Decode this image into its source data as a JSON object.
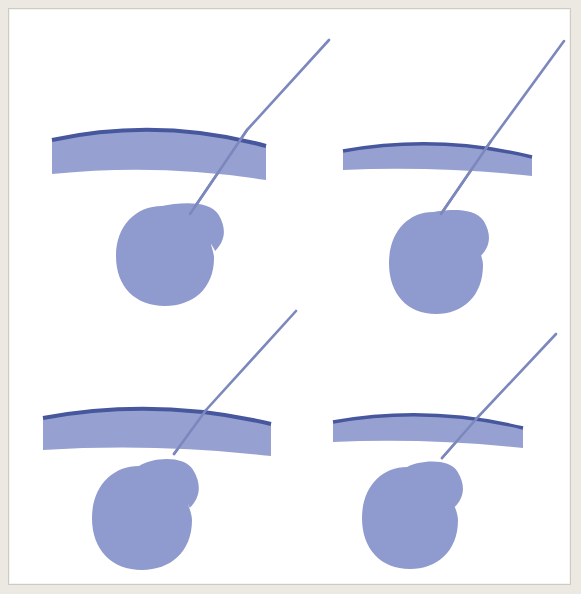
{
  "figure": {
    "background_color": "#ffffff",
    "paper_color": "#ece8e2",
    "frame_color": "#cfcac3",
    "width": 581,
    "height": 594
  },
  "palette": {
    "blob_fill": "#8f9ace",
    "blob_fill_alt": "#9aa3d2",
    "arc_fill": "#97a1d1",
    "arc_edge": "#47579e",
    "needle": "#7c88bd",
    "needle_dark": "#5a68a8",
    "white": "#ffffff"
  },
  "layout": {
    "rows": 2,
    "columns": 2,
    "cell_width": 280,
    "cell_height": 287
  },
  "chart_data": {
    "type": "scatter",
    "xlabel": "",
    "ylabel": "",
    "grid": false,
    "legend": null,
    "panels": [
      {
        "id": "panel-top-left",
        "label": "",
        "row": 0,
        "column": 0,
        "transducer_arc": {
          "start": [
            34,
            122
          ],
          "end": [
            248,
            128
          ],
          "outer_sag": 26,
          "inner_sag": 46,
          "band_thickness": 34
        },
        "needle": {
          "entry": [
            311,
            22
          ],
          "crossing": [
            229,
            112
          ],
          "tip": [
            172,
            196
          ],
          "width": 2.6
        },
        "lesion": {
          "center": [
            147,
            238
          ],
          "radius_x": 49,
          "radius_y": 50,
          "lobe_center": [
            181,
            210
          ],
          "lobe_radius": 27
        }
      },
      {
        "id": "panel-top-right",
        "label": "",
        "row": 0,
        "column": 1,
        "transducer_arc": {
          "start": [
            325,
            133
          ],
          "end": [
            514,
            139
          ],
          "outer_sag": 20,
          "inner_sag": 32,
          "band_thickness": 19
        },
        "needle": {
          "entry": [
            546,
            23
          ],
          "crossing": [
            473,
            123
          ],
          "tip": [
            423,
            196
          ],
          "width": 2.6
        },
        "lesion": {
          "center": [
            418,
            245
          ],
          "radius_x": 47,
          "radius_y": 51,
          "lobe_center": [
            447,
            216
          ],
          "lobe_radius": 26
        }
      },
      {
        "id": "panel-bottom-left",
        "label": "",
        "row": 1,
        "column": 0,
        "transducer_arc": {
          "start": [
            25,
            400
          ],
          "end": [
            253,
            406
          ],
          "outer_sag": 24,
          "inner_sag": 46,
          "band_thickness": 32
        },
        "needle": {
          "entry": [
            278,
            293
          ],
          "crossing": [
            188,
            392
          ],
          "tip": [
            156,
            436
          ],
          "width": 2.6
        },
        "lesion": {
          "center": [
            124,
            500
          ],
          "radius_x": 50,
          "radius_y": 52,
          "lobe_center": [
            155,
            466
          ],
          "lobe_radius": 28
        }
      },
      {
        "id": "panel-bottom-right",
        "label": "",
        "row": 1,
        "column": 1,
        "transducer_arc": {
          "start": [
            315,
            404
          ],
          "end": [
            505,
            410
          ],
          "outer_sag": 20,
          "inner_sag": 33,
          "band_thickness": 20
        },
        "needle": {
          "entry": [
            538,
            316
          ],
          "crossing": [
            460,
            399
          ],
          "tip": [
            424,
            440
          ],
          "width": 2.6
        },
        "lesion": {
          "center": [
            392,
            500
          ],
          "radius_x": 48,
          "radius_y": 51,
          "lobe_center": [
            421,
            467
          ],
          "lobe_radius": 26
        }
      }
    ]
  }
}
